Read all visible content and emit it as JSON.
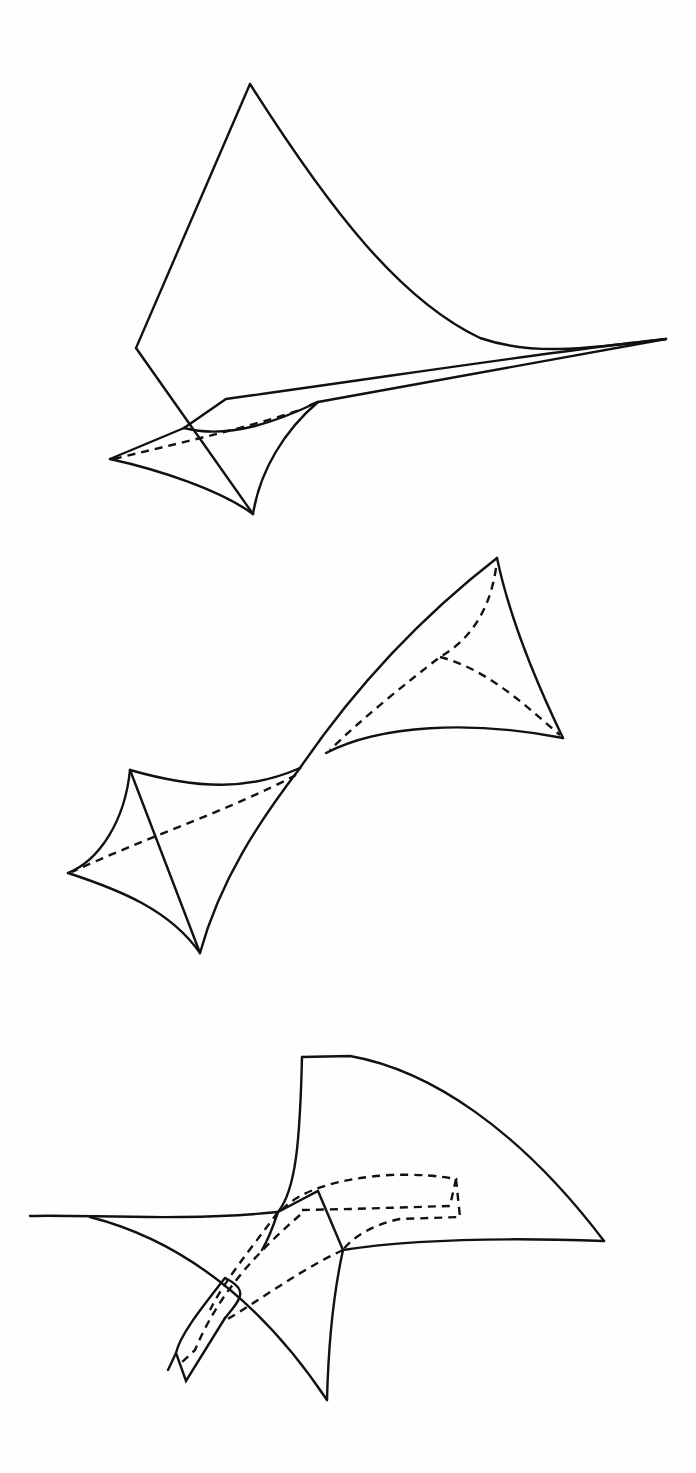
{
  "page": {
    "background": "#fefefe",
    "stroke_color": "#111111"
  },
  "figures": [
    {
      "name": "figure-top-swallowtail-surface",
      "description": "Surface with cuspidal edge and swallowtail point (upper figure)",
      "solid_paths": [
        "M 250 84 L 136 348 L 253 514",
        "M 250 84 C 330 210, 400 300, 480 338 C 530 355, 580 350, 666 339",
        "M 666 339 L 318 402 L 310 405",
        "M 666 339 C 560 350, 400 375, 226 399 L 184 428",
        "M 184 428 L 110 459",
        "M 110 459 C 160 470, 220 490, 253 514",
        "M 253 514 C 260 470, 285 430, 318 402",
        "M 184 428 C 230 440, 280 420, 318 402"
      ],
      "dashed_paths": [
        "M 114 459 C 170 445, 240 430, 300 410"
      ]
    },
    {
      "name": "figure-middle-double-cusp",
      "description": "Two curvilinear tetrahedral cusps joined at a tangency point",
      "solid_paths": [
        "M 497 558 C 430 610, 360 680, 300 768",
        "M 497 558 C 510 620, 535 680, 563 738",
        "M 563 738 C 470 720, 380 725, 326 753",
        "M 300 768 C 260 820, 220 880, 200 953",
        "M 300 768 C 250 790, 200 790, 130 770",
        "M 130 770 C 125 820, 100 860, 68 873",
        "M 68 873 C 120 890, 170 910, 200 953",
        "M 130 770 L 200 953"
      ],
      "dashed_paths": [
        "M 496 568 C 490 610, 470 640, 440 657 C 410 680, 360 720, 330 750",
        "M 440 657 C 490 670, 530 710, 560 735",
        "M 296 775 C 230 810, 140 840, 72 872"
      ]
    },
    {
      "name": "figure-bottom-folded-surface",
      "description": "Folded surface sheet with hidden strip (lower figure)",
      "solid_paths": [
        "M 30 1216 C 80 1214, 180 1222, 278 1212",
        "M 302 1057 L 350 1056 C 430 1070, 520 1130, 604 1241",
        "M 302 1057 C 300 1140, 296 1190, 278 1212 C 272 1230, 268 1240, 262 1250",
        "M 604 1241 C 520 1238, 420 1238, 343 1250",
        "M 343 1250 L 318 1191 L 278 1212",
        "M 343 1250 C 332 1300, 328 1360, 327 1400",
        "M 90 1217 C 180 1240, 260 1300, 327 1400",
        "M 225 1278 C 200 1310, 180 1335, 176 1353 L 186 1381 L 225 1318",
        "M 176 1353 L 168 1370",
        "M 225 1318 C 240 1300, 250 1290, 225 1278"
      ],
      "dashed_paths": [
        "M 282 1210 C 300 1190, 340 1178, 390 1175 C 420 1174, 440 1176, 456 1179 L 450 1206 L 350 1209 L 302 1210",
        "M 456 1179 L 460 1217 L 400 1219 C 370 1225, 350 1240, 343 1250",
        "M 343 1250 C 300 1270, 260 1300, 226 1320",
        "M 300 1215 C 260 1250, 220 1290, 195 1350 L 180 1364",
        "M 278 1212 C 250 1250, 225 1280, 210 1310"
      ]
    }
  ]
}
